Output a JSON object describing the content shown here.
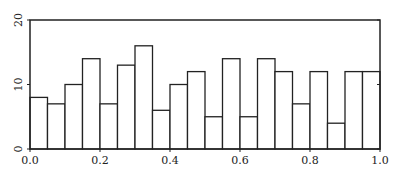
{
  "chart_data": {
    "type": "bar",
    "title": "",
    "xlabel": "",
    "ylabel": "",
    "xlim": [
      0.0,
      1.0
    ],
    "ylim": [
      0,
      20
    ],
    "grid": false,
    "legend": null,
    "bin_width": 0.05,
    "bin_edges": [
      0.0,
      0.05,
      0.1,
      0.15,
      0.2,
      0.25,
      0.3,
      0.35,
      0.4,
      0.45,
      0.5,
      0.55,
      0.6,
      0.65,
      0.7,
      0.75,
      0.8,
      0.85,
      0.9,
      0.95,
      1.0
    ],
    "values": [
      8,
      7,
      10,
      14,
      7,
      13,
      16,
      6,
      10,
      12,
      5,
      14,
      5,
      14,
      12,
      7,
      12,
      4,
      12,
      12
    ],
    "x_ticks": [
      "0.0",
      "0.2",
      "0.4",
      "0.6",
      "0.8",
      "1.0"
    ],
    "x_tick_values": [
      0.0,
      0.2,
      0.4,
      0.6,
      0.8,
      1.0
    ],
    "y_ticks": [
      "0",
      "10",
      "20"
    ],
    "y_tick_values": [
      0,
      10,
      20
    ]
  },
  "style": {
    "bar_fill": "#ffffff",
    "bar_stroke": "#222222",
    "axis_color": "#222222"
  }
}
